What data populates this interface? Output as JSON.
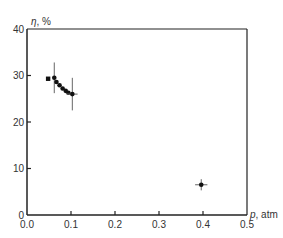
{
  "chart_data": {
    "type": "scatter",
    "title": "",
    "xlabel": "p, atm",
    "ylabel": "η, %",
    "xlabel_var": "p",
    "xlabel_unit": ", atm",
    "ylabel_var": "η",
    "ylabel_unit": ", %",
    "xlim": [
      0.0,
      0.5
    ],
    "ylim": [
      0,
      40
    ],
    "xticks": [
      0.0,
      0.1,
      0.2,
      0.3,
      0.4,
      0.5
    ],
    "xtick_labels": [
      "0.0",
      "0.1",
      "0.2",
      "0.3",
      "0.4",
      "0.5"
    ],
    "yticks": [
      0,
      10,
      20,
      30,
      40
    ],
    "ytick_labels": [
      "0",
      "10",
      "20",
      "30",
      "40"
    ],
    "grid": false,
    "legend": null,
    "series": [
      {
        "name": "measurements",
        "color": "#111111",
        "points": [
          {
            "x": 0.048,
            "y": 29.3,
            "marker": "square"
          },
          {
            "x": 0.062,
            "y": 29.5,
            "yerr": 3.3
          },
          {
            "x": 0.067,
            "y": 28.6
          },
          {
            "x": 0.074,
            "y": 27.9
          },
          {
            "x": 0.081,
            "y": 27.2
          },
          {
            "x": 0.088,
            "y": 26.7
          },
          {
            "x": 0.094,
            "y": 26.3
          },
          {
            "x": 0.103,
            "y": 26.0,
            "yerr": 3.5,
            "xerr": 0.012
          },
          {
            "x": 0.396,
            "y": 6.5,
            "yerr": 1.2,
            "xerr": 0.014
          }
        ]
      }
    ]
  }
}
